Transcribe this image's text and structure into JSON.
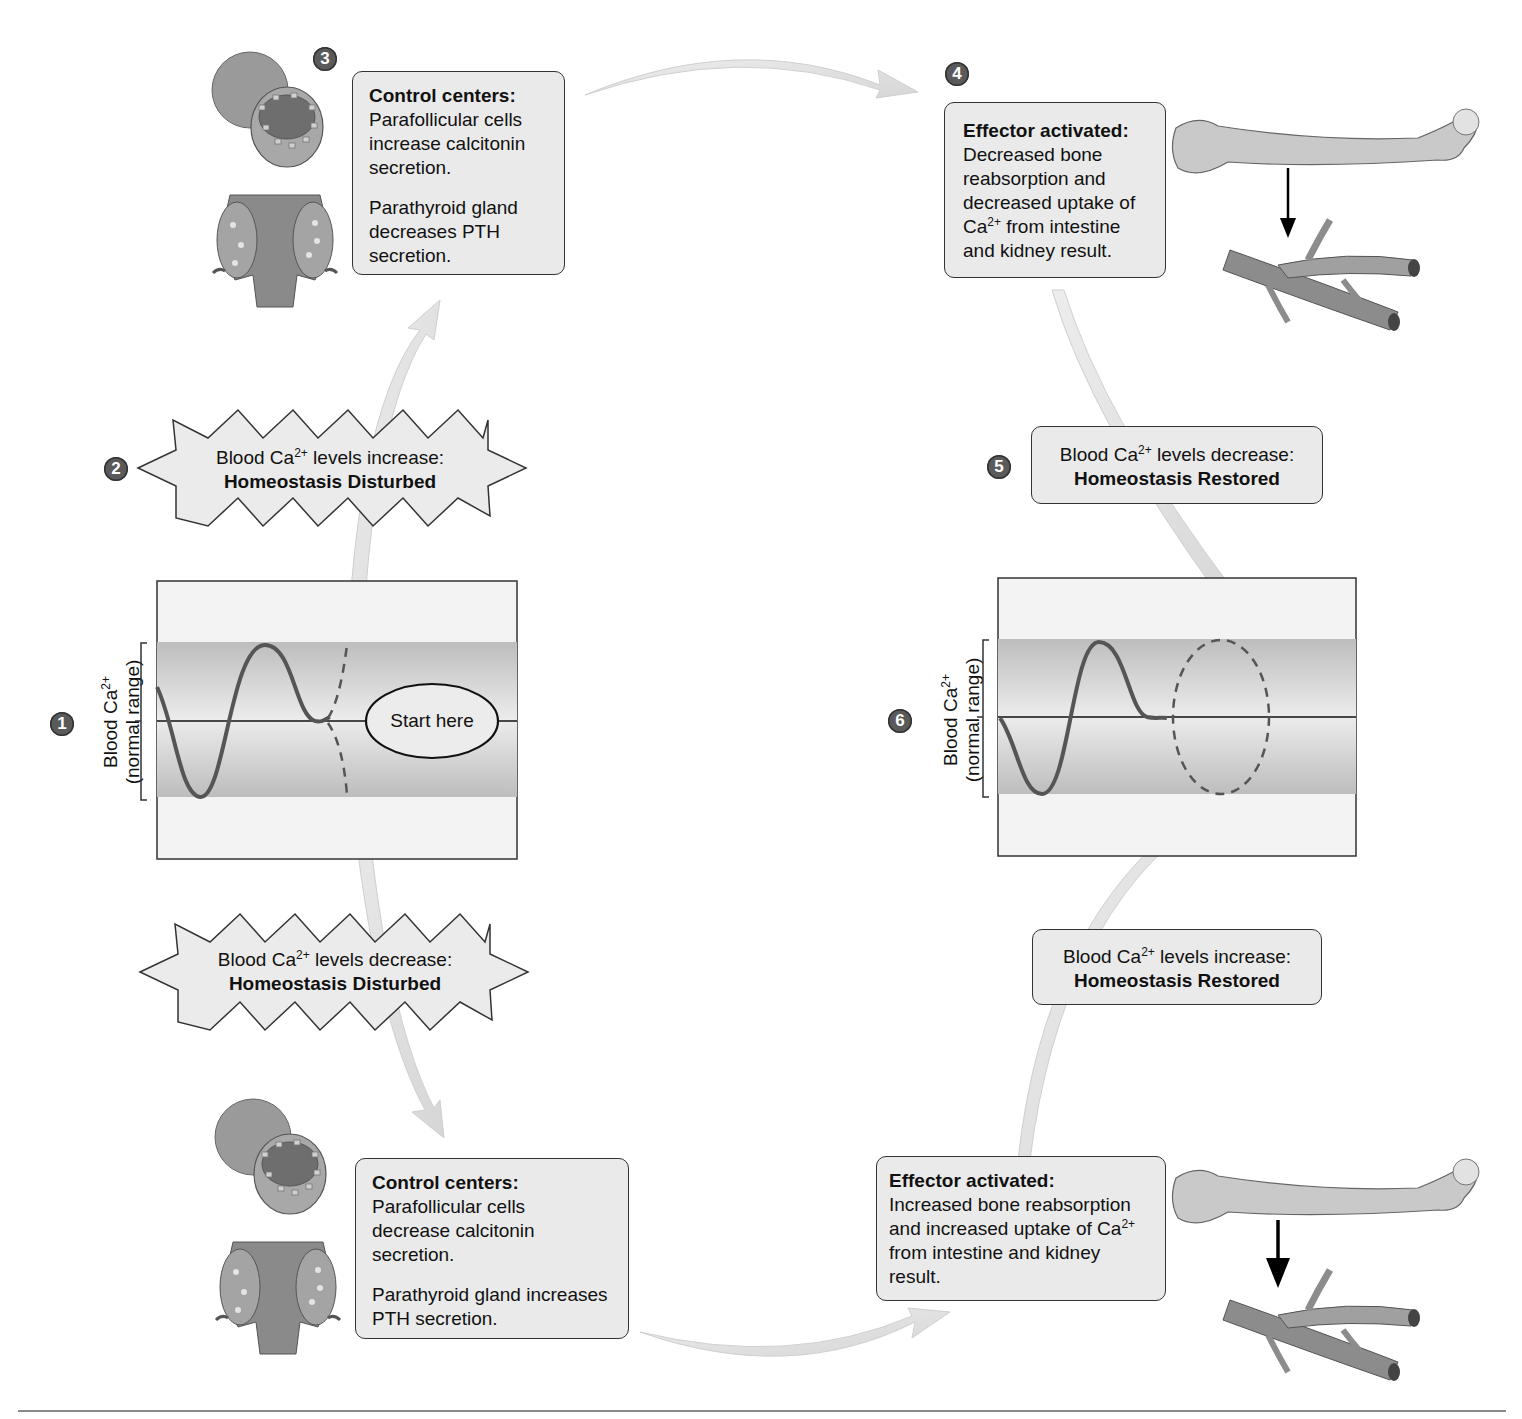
{
  "steps": {
    "s1": "1",
    "s2": "2",
    "s3": "3",
    "s4": "4",
    "s5": "5",
    "s6": "6"
  },
  "left_graph": {
    "ylabel_line1": "Blood Ca",
    "ylabel_sup": "2+",
    "ylabel_line2": "(normal range)",
    "start_label": "Start here"
  },
  "right_graph": {
    "ylabel_line1": "Blood Ca",
    "ylabel_sup": "2+",
    "ylabel_line2": "(normal range)"
  },
  "disturbed_increase": {
    "line1_pre": "Blood Ca",
    "line1_sup": "2+",
    "line1_post": " levels increase:",
    "line2": "Homeostasis Disturbed"
  },
  "disturbed_decrease": {
    "line1_pre": "Blood Ca",
    "line1_sup": "2+",
    "line1_post": " levels decrease:",
    "line2": "Homeostasis Disturbed"
  },
  "control_top": {
    "heading": "Control centers:",
    "para1": "Parafollicular cells increase calcitonin secretion.",
    "para2": "Parathyroid gland decreases PTH secretion."
  },
  "control_bottom": {
    "heading": "Control centers:",
    "para1": "Parafollicular cells decrease calcitonin secretion.",
    "para2": "Parathyroid gland increases PTH secretion."
  },
  "effector_top": {
    "heading": "Effector activated:",
    "text_pre": "Decreased bone reabsorption and decreased uptake of Ca",
    "text_sup": "2+",
    "text_post": " from intestine and kidney result."
  },
  "effector_bottom": {
    "heading": "Effector activated:",
    "text_pre": "Increased bone reabsorption and increased uptake of Ca",
    "text_sup": "2+",
    "text_post": " from intestine and kidney result."
  },
  "restored_decrease": {
    "line1_pre": "Blood Ca",
    "line1_sup": "2+",
    "line1_post": " levels decrease:",
    "line2": "Homeostasis Restored"
  },
  "restored_increase": {
    "line1_pre": "Blood Ca",
    "line1_sup": "2+",
    "line1_post": " levels increase:",
    "line2": "Homeostasis Restored"
  },
  "colors": {
    "box_fill": "#eaeaea",
    "band_fill": "#c8c8c8",
    "curve": "#555555",
    "arrow": "#e2e2e2",
    "step_badge": "#5a5a5a"
  }
}
